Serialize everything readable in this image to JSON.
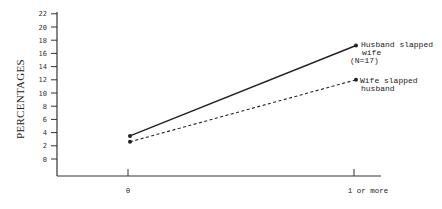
{
  "chart_data": {
    "type": "line",
    "title": "",
    "xlabel": "",
    "ylabel": "PERCENTAGES",
    "categories": [
      "0",
      "1 or more"
    ],
    "series": [
      {
        "name": "Husband slapped wife",
        "label_lines": [
          "Husband slapped",
          "wife",
          "(N=17)"
        ],
        "style": "solid",
        "values": [
          3.5,
          17.2
        ]
      },
      {
        "name": "Wife slapped husband",
        "label_lines": [
          "Wife slapped",
          "husband"
        ],
        "style": "dashed",
        "values": [
          2.6,
          12.0
        ]
      }
    ],
    "yticks": [
      0,
      2,
      4,
      6,
      8,
      10,
      12,
      14,
      16,
      18,
      20,
      22
    ],
    "ylim": [
      0,
      22
    ],
    "grid": false,
    "legend_position": "inline-right"
  },
  "axes": {
    "y_label": "PERCENTAGES",
    "x_tick_labels": [
      "0",
      "1 or more"
    ]
  },
  "annotations": {
    "husband": [
      "Husband slapped",
      "wife",
      "(N=17)"
    ],
    "wife": [
      "Wife slapped",
      "husband"
    ]
  },
  "colors": {
    "line": "#222222",
    "axis": "#333333",
    "background": "#ffffff"
  }
}
